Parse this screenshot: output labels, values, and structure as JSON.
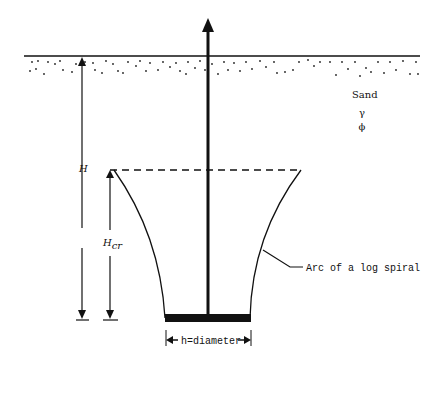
{
  "figure": {
    "type": "anchor uplift diagram",
    "medium_label": "Sand",
    "soil_params": [
      "γ",
      "ϕ"
    ],
    "labels": {
      "H": "H",
      "Hcr_main": "H",
      "Hcr_sub": "cr",
      "arc": "Arc of a log spiral",
      "diameter": "h=diameter"
    }
  },
  "colors": {
    "ink": "#111111",
    "background": "#ffffff"
  }
}
